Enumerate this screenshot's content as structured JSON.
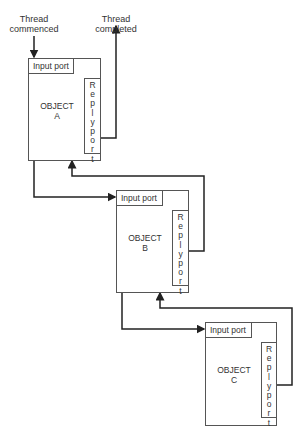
{
  "labels": {
    "thread_commenced": "Thread commenced",
    "thread_commenced_line1": "Thread",
    "thread_commenced_line2": "commenced",
    "thread_completed_line1": "Thread",
    "thread_completed_line2": "completed"
  },
  "objects": [
    {
      "name_line1": "OBJECT",
      "name_line2": "A",
      "input_port": "Input port",
      "reply_port": "Replyport"
    },
    {
      "name_line1": "OBJECT",
      "name_line2": "B",
      "input_port": "Input port",
      "reply_port": "Replyport"
    },
    {
      "name_line1": "OBJECT",
      "name_line2": "C",
      "input_port": "Input port",
      "reply_port": "Replyport"
    }
  ],
  "colors": {
    "line": "#333333",
    "box_border": "#555555",
    "background": "#ffffff"
  }
}
